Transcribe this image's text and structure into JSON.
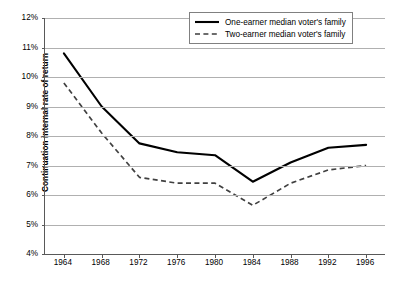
{
  "chart_data": {
    "type": "line",
    "title": "",
    "xlabel": "",
    "ylabel": "Continuation internal rate of return",
    "x": [
      1964,
      1968,
      1972,
      1976,
      1980,
      1984,
      1988,
      1992,
      1996
    ],
    "xlim": [
      1962,
      1998
    ],
    "ylim": [
      4,
      12
    ],
    "ytick_labels": [
      "12%",
      "11%",
      "10%",
      "9%",
      "8%",
      "7%",
      "6%",
      "5%",
      "4%"
    ],
    "ytick_values": [
      12,
      11,
      10,
      9,
      8,
      7,
      6,
      5,
      4
    ],
    "xtick_labels": [
      "1964",
      "1968",
      "1972",
      "1976",
      "1980",
      "1984",
      "1988",
      "1992",
      "1996"
    ],
    "grid": "horizontal",
    "legend_position": "top-right",
    "series": [
      {
        "name": "One-earner median voter's family",
        "style": "solid",
        "color": "#000000",
        "values": [
          10.8,
          9.0,
          7.75,
          7.45,
          7.35,
          6.45,
          7.1,
          7.6,
          7.7
        ]
      },
      {
        "name": "Two-earner median voter's family",
        "style": "dashed",
        "color": "#404040",
        "values": [
          9.8,
          8.1,
          6.6,
          6.4,
          6.4,
          5.65,
          6.4,
          6.85,
          7.0
        ]
      }
    ]
  },
  "axis": {
    "y_title": "Continuation internal rate of return"
  },
  "legend": {
    "entries": [
      {
        "label": "One-earner median voter's family",
        "style": "solid"
      },
      {
        "label": "Two-earner median voter's family",
        "style": "dashed"
      }
    ]
  }
}
